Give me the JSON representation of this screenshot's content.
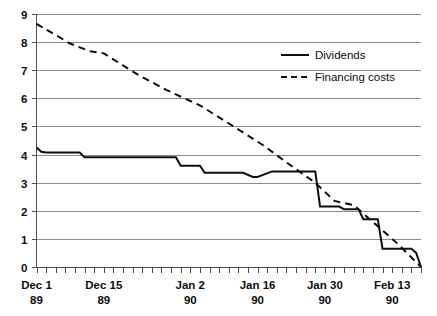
{
  "chart_data": {
    "type": "line",
    "title": "",
    "subtitle": "",
    "xlabel": "",
    "ylabel": "",
    "ylim": [
      0,
      9
    ],
    "xlim": [
      0,
      80
    ],
    "grid": "horizontal",
    "legend_position": "top-right",
    "y_ticks": [
      "9",
      "8",
      "7",
      "6",
      "5",
      "4",
      "3",
      "2",
      "1",
      "0"
    ],
    "y_tick_values": [
      9,
      8,
      7,
      6,
      5,
      4,
      3,
      2,
      1,
      0
    ],
    "x_ticks": [
      {
        "line1": "Dec 1",
        "line2": "89",
        "x": 0
      },
      {
        "line1": "Dec 15",
        "line2": "89",
        "x": 14
      },
      {
        "line1": "Jan 2",
        "line2": "90",
        "x": 32
      },
      {
        "line1": "Jan 16",
        "line2": "90",
        "x": 46
      },
      {
        "line1": "Jan 30",
        "line2": "90",
        "x": 60
      },
      {
        "line1": "Feb 13",
        "line2": "90",
        "x": 74
      }
    ],
    "minor_tick_interval": 2,
    "series": [
      {
        "name": "Dividends",
        "style": "solid",
        "color": "#0d0d0d",
        "x": [
          0,
          1,
          2,
          9,
          10,
          29,
          30,
          34,
          35,
          43,
          45,
          46,
          49,
          50,
          58,
          59,
          63,
          64,
          67,
          68,
          71,
          72,
          78,
          79,
          80
        ],
        "values": [
          4.25,
          4.1,
          4.07,
          4.07,
          3.9,
          3.9,
          3.6,
          3.6,
          3.35,
          3.35,
          3.2,
          3.2,
          3.4,
          3.4,
          3.4,
          2.15,
          2.15,
          2.05,
          2.05,
          1.7,
          1.7,
          0.65,
          0.65,
          0.5,
          0.0
        ]
      },
      {
        "name": "Financing costs",
        "style": "dashed",
        "color": "#0d0d0d",
        "x": [
          0,
          7,
          11,
          14,
          21,
          27,
          34,
          41,
          47,
          53,
          58,
          62,
          66,
          70,
          75,
          80
        ],
        "values": [
          8.65,
          7.95,
          7.68,
          7.6,
          6.85,
          6.3,
          5.75,
          5.0,
          4.35,
          3.6,
          3.0,
          2.35,
          2.2,
          1.6,
          0.85,
          0.0
        ]
      }
    ],
    "legend_entries": [
      {
        "label": "Dividends",
        "style": "solid"
      },
      {
        "label": "Financing costs",
        "style": "dashed"
      }
    ]
  }
}
